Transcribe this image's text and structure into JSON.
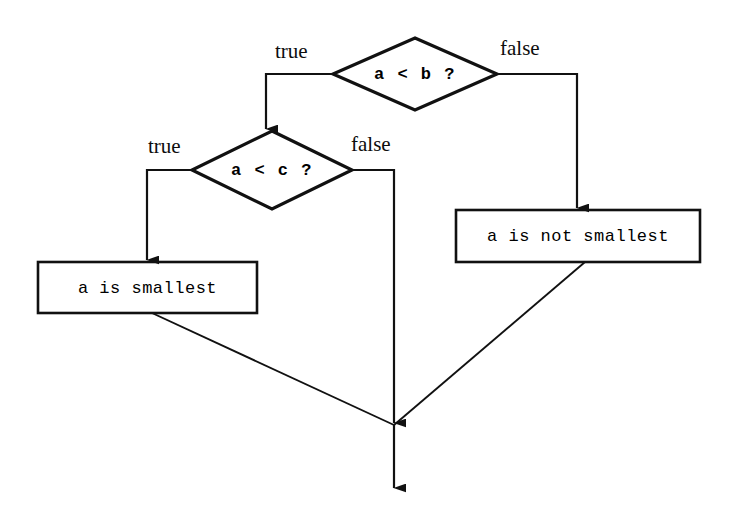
{
  "diagram": {
    "stroke_color": "#111111",
    "background_color": "#ffffff",
    "nodes": [
      {
        "id": "decision_a_lt_b",
        "shape": "diamond",
        "text": "a < b ?",
        "cx": 415,
        "cy": 74,
        "rx": 82,
        "ry": 36
      },
      {
        "id": "decision_a_lt_c",
        "shape": "diamond",
        "text": "a < c ?",
        "cx": 272,
        "cy": 170,
        "rx": 80,
        "ry": 39
      },
      {
        "id": "result_a_smallest",
        "shape": "rectangle",
        "text": "a is smallest",
        "x": 38,
        "y": 262,
        "w": 219,
        "h": 51
      },
      {
        "id": "result_a_not_smallest",
        "shape": "rectangle",
        "text": "a is not smallest",
        "x": 456,
        "y": 210,
        "w": 244,
        "h": 52
      }
    ],
    "edge_labels": [
      {
        "id": "label_b_true",
        "text": "true",
        "x": 275,
        "y": 41
      },
      {
        "id": "label_b_false",
        "text": "false",
        "x": 500,
        "y": 38
      },
      {
        "id": "label_c_true",
        "text": "true",
        "x": 148,
        "y": 136
      },
      {
        "id": "label_c_false",
        "text": "false",
        "x": 351,
        "y": 134
      }
    ],
    "junction": {
      "x": 394,
      "y": 425
    },
    "exit_arrow_end_y": 490
  }
}
